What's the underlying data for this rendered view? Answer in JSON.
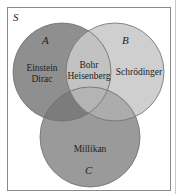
{
  "diagram": {
    "universe_label": "S",
    "sets": [
      {
        "id": "A",
        "label": "A",
        "color": "#8f8f8f"
      },
      {
        "id": "B",
        "label": "B",
        "color": "#cfcfcf"
      },
      {
        "id": "C",
        "label": "C",
        "color": "#9a9a9a"
      }
    ],
    "regions": {
      "a_only": {
        "line1": "Einstein",
        "line2": "Dirac"
      },
      "a_and_b": {
        "line1": "Bohr",
        "line2": "Heisenberg"
      },
      "b_only": {
        "line1": "Schrödinger"
      },
      "c_only": {
        "line1": "Millikan"
      }
    },
    "colors": {
      "background": "#ffffff",
      "border": "#8a8a8a",
      "circle_stroke": "#6e6e6e",
      "a_and_c": "#7c7c7c",
      "b_and_c": "#acacac",
      "a_and_b": "#c2c2c2",
      "center": "#b4b4b4"
    }
  }
}
